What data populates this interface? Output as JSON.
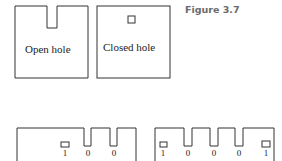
{
  "figure_label": "Figure 3.7",
  "top_cards": [
    {
      "label": "Open hole",
      "type": "open"
    },
    {
      "label": "Closed hole",
      "type": "closed"
    }
  ],
  "bottom_cards": [
    {
      "digits": [
        "1",
        "0",
        "0"
      ]
    },
    {
      "digits": [
        "1",
        "0",
        "0",
        "0",
        "1"
      ]
    }
  ],
  "colors": {
    "line": "#333333",
    "caption": "#6b6b6b"
  }
}
